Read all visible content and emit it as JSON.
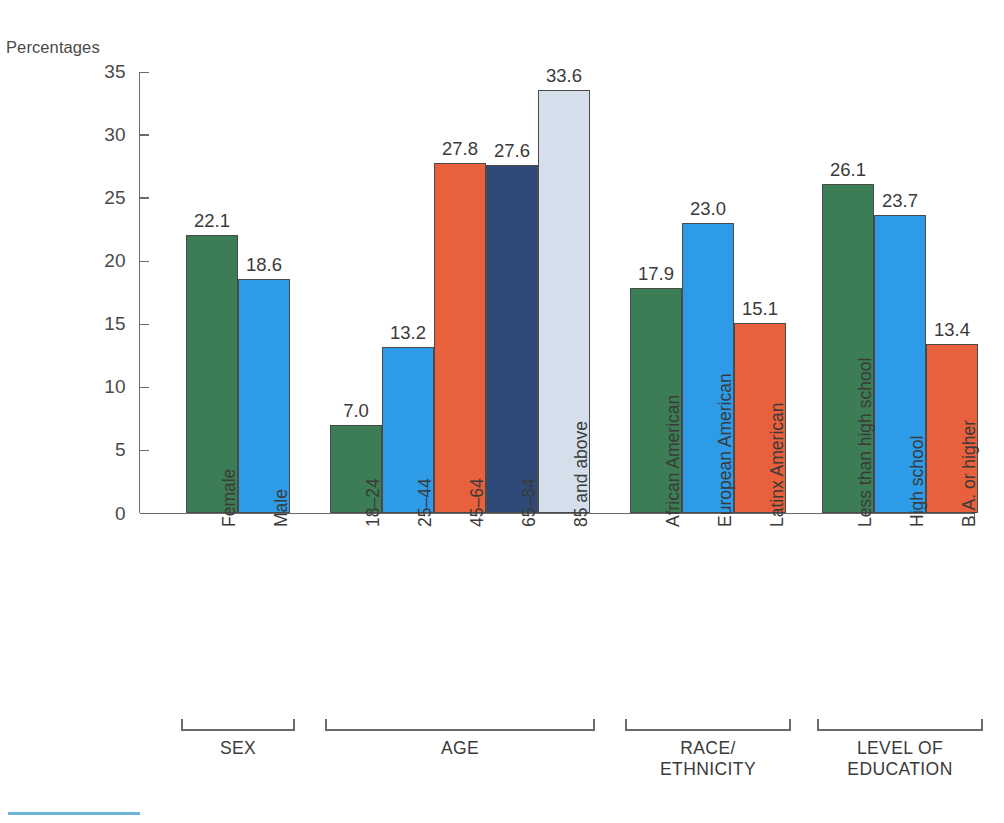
{
  "chart_data": {
    "type": "bar",
    "title": "",
    "ylabel": "Percentages",
    "xlabel": "",
    "ylim": [
      0,
      35
    ],
    "ytick_step": 5,
    "yticks": [
      "0",
      "5",
      "10",
      "15",
      "20",
      "25",
      "30",
      "35"
    ],
    "grid": false,
    "legend": "none",
    "value_label_format": "one-decimal",
    "categories": [
      "Female",
      "Male",
      "18–24",
      "25–44",
      "45–64",
      "65–84",
      "85 and above",
      "African American",
      "European American",
      "Latinx American",
      "Less than high school",
      "High school",
      "B.A. or higher"
    ],
    "values": [
      22.1,
      18.6,
      7.0,
      13.2,
      27.8,
      27.6,
      33.6,
      17.9,
      23.0,
      15.1,
      26.1,
      23.7,
      13.4
    ],
    "value_labels": [
      "22.1",
      "18.6",
      "7.0",
      "13.2",
      "27.8",
      "27.6",
      "33.6",
      "17.9",
      "23.0",
      "15.1",
      "26.1",
      "23.7",
      "13.4"
    ],
    "bar_colors": [
      "#3d7d55",
      "#2e9be8",
      "#3d7d55",
      "#2e9be8",
      "#e8603c",
      "#2f4a78",
      "#d5dfeb",
      "#3d7d55",
      "#2e9be8",
      "#e8603c",
      "#3d7d55",
      "#2e9be8",
      "#e8603c"
    ],
    "groups": [
      {
        "name": "SEX",
        "categories": [
          "Female",
          "Male"
        ],
        "values": [
          22.1,
          18.6
        ]
      },
      {
        "name": "AGE",
        "categories": [
          "18–24",
          "25–44",
          "45–64",
          "65–84",
          "85 and above"
        ],
        "values": [
          7.0,
          13.2,
          27.8,
          27.6,
          33.6
        ]
      },
      {
        "name": "RACE/\nETHNICITY",
        "categories": [
          "African American",
          "European American",
          "Latinx American"
        ],
        "values": [
          17.9,
          23.0,
          15.1
        ]
      },
      {
        "name": "LEVEL OF\nEDUCATION",
        "categories": [
          "Less than high school",
          "High school",
          "B.A. or higher"
        ],
        "values": [
          26.1,
          23.7,
          13.4
        ]
      }
    ]
  },
  "palette": {
    "green": "#3d7d55",
    "blue": "#2e9be8",
    "orange": "#e8603c",
    "navy": "#2f4a78",
    "pale_blue": "#d5dfeb",
    "axis": "#6a6a6a",
    "text": "#3a3a3a",
    "rule": "#6cb4d6"
  },
  "axis": {
    "y_label": "Percentages",
    "ticks": [
      {
        "value": "35"
      },
      {
        "value": "30"
      },
      {
        "value": "25"
      },
      {
        "value": "20"
      },
      {
        "value": "15"
      },
      {
        "value": "10"
      },
      {
        "value": "5"
      },
      {
        "value": "0"
      }
    ]
  },
  "bars": [
    {
      "label": "Female",
      "value_label": "22.1"
    },
    {
      "label": "Male",
      "value_label": "18.6"
    },
    {
      "label": "18–24",
      "value_label": "7.0"
    },
    {
      "label": "25–44",
      "value_label": "13.2"
    },
    {
      "label": "45–64",
      "value_label": "27.8"
    },
    {
      "label": "65–84",
      "value_label": "27.6"
    },
    {
      "label": "85 and above",
      "value_label": "33.6"
    },
    {
      "label": "African American",
      "value_label": "17.9"
    },
    {
      "label": "European American",
      "value_label": "23.0"
    },
    {
      "label": "Latinx American",
      "value_label": "15.1"
    },
    {
      "label": "Less than high school",
      "value_label": "26.1"
    },
    {
      "label": "High school",
      "value_label": "23.7"
    },
    {
      "label": "B.A. or higher",
      "value_label": "13.4"
    }
  ],
  "group_labels": [
    {
      "name": "SEX"
    },
    {
      "name": "AGE"
    },
    {
      "name": "RACE/\nETHNICITY"
    },
    {
      "name": "LEVEL OF\nEDUCATION"
    }
  ]
}
